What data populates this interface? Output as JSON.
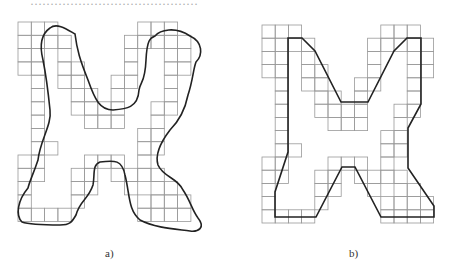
{
  "header": {
    "cutoff_text": "……………………………………"
  },
  "panels": [
    {
      "id": "a",
      "caption": "a)",
      "description": "grid cells with smooth freehand closed boundary curve"
    },
    {
      "id": "b",
      "caption": "b)",
      "description": "grid cells with polygonal approximation of boundary"
    }
  ],
  "colors": {
    "grid": "#999999",
    "curve": "#222222"
  }
}
